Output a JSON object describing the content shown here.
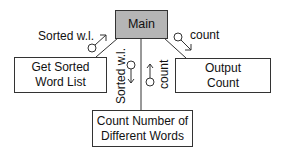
{
  "diagram": {
    "type": "structure-chart",
    "modules": {
      "main": "Main",
      "get_sorted": "Get Sorted\nWord List",
      "output_count": "Output\nCount",
      "count_words": "Count Number of\nDifferent Words"
    },
    "module_lines": {
      "get_sorted": [
        "Get Sorted",
        "Word List"
      ],
      "output_count": [
        "Output",
        "Count"
      ],
      "count_words": [
        "Count Number of",
        "Different Words"
      ]
    },
    "couples": {
      "get_sorted_out": "Sorted w.l.",
      "output_in": "count",
      "count_words_in": "Sorted w.l.",
      "count_words_out": "count"
    },
    "colors": {
      "main_fill": "#b5b5b5",
      "line": "#333333"
    }
  }
}
